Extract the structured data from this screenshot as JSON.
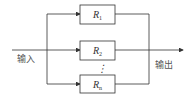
{
  "diagram": {
    "type": "parallel-block-diagram",
    "input_label": "输入",
    "output_label": "输出",
    "blocks": [
      {
        "id": "R1",
        "label": "R",
        "subscript": "1"
      },
      {
        "id": "R2",
        "label": "R",
        "subscript": "2"
      },
      {
        "id": "Rn",
        "label": "R",
        "subscript": "n"
      }
    ],
    "ellipsis": "⋮",
    "colors": {
      "line": "#333333",
      "text": "#555555",
      "background": "#ffffff"
    }
  }
}
